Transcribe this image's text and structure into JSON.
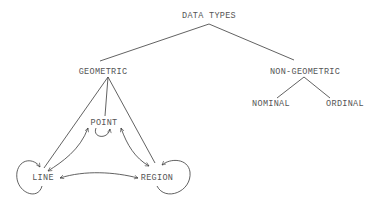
{
  "diagram": {
    "root": {
      "label": "DATA TYPES"
    },
    "branches": [
      {
        "label": "GEOMETRIC",
        "children": [
          {
            "label": "POINT"
          },
          {
            "label": "LINE"
          },
          {
            "label": "REGION"
          }
        ]
      },
      {
        "label": "NON-GEOMETRIC",
        "children": [
          {
            "label": "NOMINAL"
          },
          {
            "label": "ORDINAL"
          }
        ]
      }
    ],
    "transitions": [
      {
        "from": "POINT",
        "to": "POINT",
        "type": "self-loop"
      },
      {
        "from": "LINE",
        "to": "LINE",
        "type": "self-loop"
      },
      {
        "from": "REGION",
        "to": "REGION",
        "type": "self-loop"
      },
      {
        "from": "POINT",
        "to": "LINE",
        "type": "bidirectional"
      },
      {
        "from": "POINT",
        "to": "REGION",
        "type": "bidirectional"
      },
      {
        "from": "LINE",
        "to": "REGION",
        "type": "bidirectional"
      }
    ],
    "colors": {
      "text": "#555555",
      "line": "#3a3a3a",
      "background": "#ffffff"
    }
  }
}
